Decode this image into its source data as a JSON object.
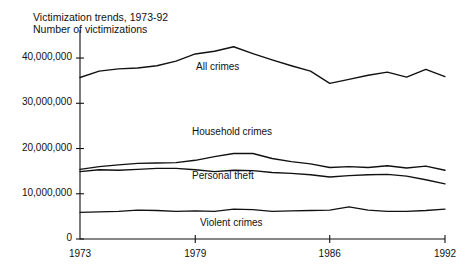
{
  "chart_data": {
    "type": "line",
    "title": "Victimization trends, 1973-92",
    "subtitle": "Number of victimizations",
    "xlabel": "",
    "ylabel": "",
    "xlim": [
      1973,
      1992
    ],
    "ylim": [
      0,
      44000000
    ],
    "grid": false,
    "legend_position": "inline-labels",
    "x": [
      1973,
      1974,
      1975,
      1976,
      1977,
      1978,
      1979,
      1980,
      1981,
      1982,
      1983,
      1984,
      1985,
      1986,
      1987,
      1988,
      1989,
      1990,
      1991,
      1992
    ],
    "y_ticks": [
      0,
      10000000,
      20000000,
      30000000,
      40000000
    ],
    "y_tick_labels": [
      "0",
      "10,000,000",
      "20,000,000",
      "30,000,000",
      "40,000,000"
    ],
    "x_ticks": [
      1973,
      1979,
      1986,
      1992
    ],
    "x_tick_labels": [
      "1973",
      "1979",
      "1986",
      "1992"
    ],
    "series": [
      {
        "name": "All crimes",
        "label": "All crimes",
        "values": [
          35700000,
          37100000,
          37600000,
          37800000,
          38300000,
          39300000,
          40900000,
          41500000,
          42500000,
          41000000,
          39600000,
          38300000,
          37100000,
          34400000,
          35300000,
          36200000,
          36900000,
          35800000,
          37500000,
          35900000
        ]
      },
      {
        "name": "Household crimes",
        "label": "Household crimes",
        "values": [
          15400000,
          16000000,
          16400000,
          16700000,
          16800000,
          16900000,
          17400000,
          18200000,
          18900000,
          18900000,
          17800000,
          17100000,
          16600000,
          15800000,
          16000000,
          15800000,
          16200000,
          15700000,
          16100000,
          15200000
        ]
      },
      {
        "name": "Personal theft",
        "label": "Personal theft",
        "values": [
          14900000,
          15300000,
          15200000,
          15400000,
          15600000,
          15600000,
          15300000,
          14900000,
          15200000,
          15100000,
          14700000,
          14500000,
          14200000,
          13700000,
          14000000,
          14200000,
          14300000,
          13900000,
          13100000,
          12200000
        ]
      },
      {
        "name": "Violent crimes",
        "label": "Violent crimes",
        "values": [
          5900000,
          6000000,
          6100000,
          6400000,
          6300000,
          6100000,
          6200000,
          6100000,
          6600000,
          6500000,
          6100000,
          6200000,
          6300000,
          6400000,
          7100000,
          6400000,
          6100000,
          6100000,
          6300000,
          6600000
        ]
      }
    ],
    "series_label_positions": [
      {
        "name": "All crimes",
        "x": 196,
        "y": 61
      },
      {
        "name": "Household crimes",
        "x": 192,
        "y": 126
      },
      {
        "name": "Personal theft",
        "x": 192,
        "y": 170
      },
      {
        "name": "Violent crimes",
        "x": 200,
        "y": 217
      }
    ],
    "colors": {
      "line": "#111111",
      "axis": "#111111",
      "background": "#ffffff"
    },
    "plot_box": {
      "left": 80,
      "right": 445,
      "top": 30,
      "bottom": 239,
      "y_top_value": 46200000
    }
  }
}
